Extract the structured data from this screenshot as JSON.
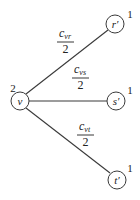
{
  "diagram": {
    "nodes": [
      {
        "id": "v",
        "label": "v",
        "weight": "2"
      },
      {
        "id": "r",
        "label": "r′",
        "weight": "1"
      },
      {
        "id": "s",
        "label": "s′",
        "weight": "1"
      },
      {
        "id": "t",
        "label": "t′",
        "weight": "1"
      }
    ],
    "edges": [
      {
        "from": "v",
        "to": "r",
        "numerator_base": "c",
        "numerator_sub": "vr",
        "denominator": "2"
      },
      {
        "from": "v",
        "to": "s",
        "numerator_base": "c",
        "numerator_sub": "vs",
        "denominator": "2"
      },
      {
        "from": "v",
        "to": "t",
        "numerator_base": "c",
        "numerator_sub": "vt",
        "denominator": "2"
      }
    ]
  }
}
